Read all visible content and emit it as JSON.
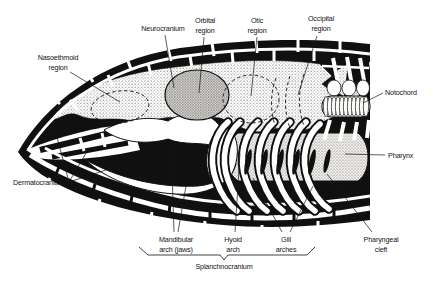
{
  "diagram": {
    "colors": {
      "ink": "#141414",
      "paper": "#ffffff",
      "stipple_gray": "#55534f"
    },
    "labels": {
      "nasoethmoid": {
        "line1": "Nasoethmoid",
        "line2": "region"
      },
      "neurocranium": {
        "line1": "Neurocranium"
      },
      "orbital": {
        "line1": "Orbital",
        "line2": "region"
      },
      "otic": {
        "line1": "Otic",
        "line2": "region"
      },
      "occipital": {
        "line1": "Occipital",
        "line2": "region"
      },
      "notochord": {
        "line1": "Notochord"
      },
      "pharynx": {
        "line1": "Pharynx"
      },
      "dermatocranium": {
        "line1": "Dermatocranium"
      },
      "mandibular_arch": {
        "line1": "Mandibular",
        "line2": "arch (jaws)"
      },
      "hyoid_arch": {
        "line1": "Hyoid",
        "line2": "arch"
      },
      "gill_arches": {
        "line1": "Gill",
        "line2": "arches"
      },
      "pharyngeal_cleft": {
        "line1": "Pharyngeal",
        "line2": "cleft"
      },
      "splanchnocranium": {
        "line1": "Splanchnocranium"
      }
    }
  }
}
